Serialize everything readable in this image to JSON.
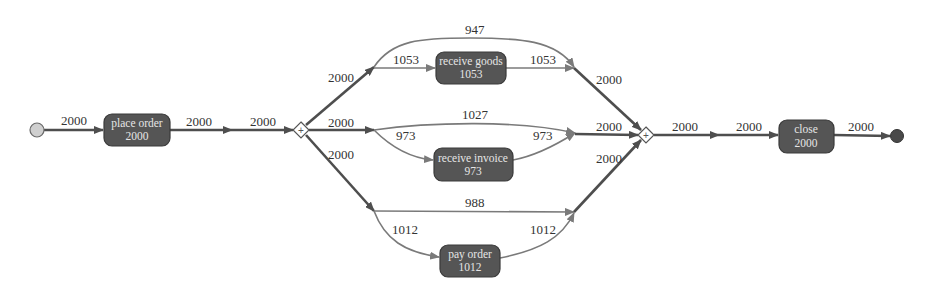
{
  "diagram": {
    "type": "process-model",
    "colors": {
      "activity_fill": "#555555",
      "activity_text": "#e6e6e6",
      "edge_thick": "#4e4e4e",
      "edge_thin": "#7a7a7a",
      "start_fill": "#cfcfcf",
      "end_fill": "#4a4a4a",
      "background": "#ffffff"
    },
    "start": {
      "label": "start"
    },
    "end": {
      "label": "end"
    },
    "activities": [
      {
        "id": "place_order",
        "name": "place order",
        "count": "2000"
      },
      {
        "id": "receive_goods",
        "name": "receive goods",
        "count": "1053"
      },
      {
        "id": "receive_invoice",
        "name": "receive invoice",
        "count": "973"
      },
      {
        "id": "pay_order",
        "name": "pay order",
        "count": "1012"
      },
      {
        "id": "close",
        "name": "close",
        "count": "2000"
      }
    ],
    "gateways": [
      {
        "id": "and_split",
        "symbol": "+"
      },
      {
        "id": "and_join",
        "symbol": "+"
      }
    ],
    "edges": [
      {
        "from": "start",
        "to": "place_order",
        "label": "2000"
      },
      {
        "from": "place_order",
        "to": "dot1",
        "label": "2000"
      },
      {
        "from": "dot1",
        "to": "and_split",
        "label": "2000"
      },
      {
        "from": "and_split",
        "to": "upper_branch",
        "label": "2000"
      },
      {
        "from": "and_split",
        "to": "middle_branch",
        "label": "2000"
      },
      {
        "from": "and_split",
        "to": "lower_branch",
        "label": "2000"
      },
      {
        "from": "upper_branch",
        "to": "receive_goods",
        "label": "1053"
      },
      {
        "from": "receive_goods",
        "to": "upper_join",
        "label": "1053"
      },
      {
        "from": "upper_branch",
        "to": "upper_join",
        "label": "947"
      },
      {
        "from": "upper_join",
        "to": "and_join",
        "label": "2000"
      },
      {
        "from": "middle_branch",
        "to": "middle_join",
        "label": "1027"
      },
      {
        "from": "middle_branch",
        "to": "receive_invoice",
        "label": "973"
      },
      {
        "from": "receive_invoice",
        "to": "middle_join",
        "label": "973"
      },
      {
        "from": "middle_join",
        "to": "and_join",
        "label": "2000"
      },
      {
        "from": "lower_branch",
        "to": "lower_join",
        "label": "988"
      },
      {
        "from": "lower_branch",
        "to": "pay_order",
        "label": "1012"
      },
      {
        "from": "pay_order",
        "to": "lower_join",
        "label": "1012"
      },
      {
        "from": "lower_join",
        "to": "and_join",
        "label": "2000"
      },
      {
        "from": "and_join",
        "to": "dot2",
        "label": "2000"
      },
      {
        "from": "dot2",
        "to": "close",
        "label": "2000"
      },
      {
        "from": "close",
        "to": "end",
        "label": "2000"
      }
    ]
  }
}
